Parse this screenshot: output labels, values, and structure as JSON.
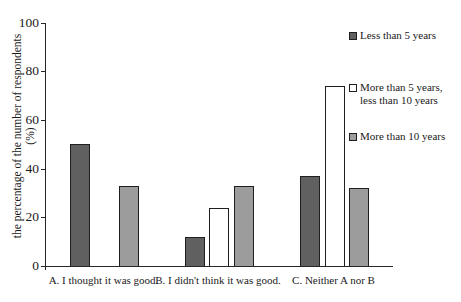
{
  "chart_data": {
    "type": "bar",
    "title": "",
    "categories": [
      "A. I thought it was good.",
      "B. I didn't think it was good.",
      "C. Neither A nor B"
    ],
    "series": [
      {
        "name": "Less than 5 years",
        "values": [
          50,
          12,
          37
        ],
        "fill": "#606060"
      },
      {
        "name": "More than 5 years, less than 10 years",
        "values": [
          0,
          24,
          74
        ],
        "fill": "#ffffff"
      },
      {
        "name": "More than 10 years",
        "values": [
          33,
          33,
          32
        ],
        "fill": "#9c9c9c"
      }
    ],
    "xlabel": "",
    "ylabel": "the percentage of the number of respondents (%)",
    "ylabel_lines": [
      "the percentage of the number of respondents",
      "(%)"
    ],
    "yticks": [
      0,
      20,
      40,
      60,
      80,
      100
    ],
    "ylim": [
      0,
      100
    ],
    "grid": false,
    "legend_position": "upper right",
    "axis_color": "#262626",
    "bar_border_color": "#1f1f1f"
  }
}
